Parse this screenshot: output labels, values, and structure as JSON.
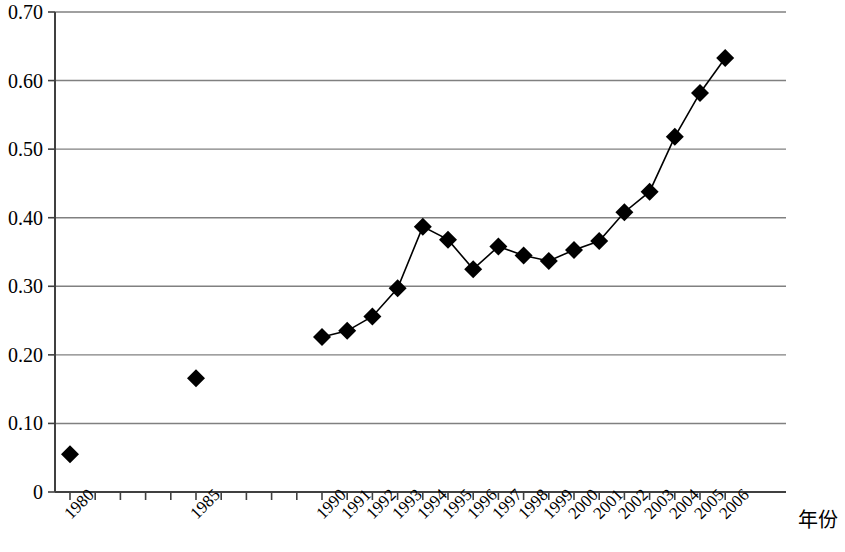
{
  "chart_data": {
    "type": "line",
    "title": "",
    "subtitle": "",
    "xlabel": "年份",
    "ylabel": "",
    "grid": true,
    "legend": null,
    "marker": "filled-diamond",
    "marker_color": "#000000",
    "line_color": "#000000",
    "grid_color": "#808080",
    "axis_color": "#404040",
    "xlim": [
      1979.5,
      2006.5
    ],
    "ylim": [
      0,
      0.7
    ],
    "y_ticks": [
      0,
      0.1,
      0.2,
      0.3,
      0.4,
      0.5,
      0.6,
      0.7
    ],
    "y_tick_labels": [
      "0",
      "0.10",
      "0.20",
      "0.30",
      "0.40",
      "0.50",
      "0.60",
      "0.70"
    ],
    "x_ticks": [
      1980,
      1981,
      1982,
      1983,
      1984,
      1985,
      1986,
      1987,
      1988,
      1989,
      1990,
      1991,
      1992,
      1993,
      1994,
      1995,
      1996,
      1997,
      1998,
      1999,
      2000,
      2001,
      2002,
      2003,
      2004,
      2005,
      2006
    ],
    "x_tick_labels": [
      "1980",
      "",
      "",
      "",
      "",
      "1985",
      "",
      "",
      "",
      "",
      "1990",
      "1991",
      "1992",
      "1993",
      "1994",
      "1995",
      "1996",
      "1997",
      "1998",
      "1999",
      "2000",
      "2001",
      "2002",
      "2003",
      "2004",
      "2005",
      "2006"
    ],
    "series": [
      {
        "name": "series-1",
        "connected": false,
        "x": [
          1980
        ],
        "values": [
          0.055
        ]
      },
      {
        "name": "series-2",
        "connected": false,
        "x": [
          1985
        ],
        "values": [
          0.166
        ]
      },
      {
        "name": "series-3",
        "connected": true,
        "x": [
          1990,
          1991,
          1992,
          1993,
          1994,
          1995,
          1996,
          1997,
          1998,
          1999,
          2000,
          2001,
          2002,
          2003,
          2004,
          2005
        ],
        "values": [
          0.226,
          0.235,
          0.256,
          0.297,
          0.387,
          0.368,
          0.325,
          0.358,
          0.345,
          0.337,
          0.353,
          0.366,
          0.408,
          0.438,
          0.518,
          0.582
        ]
      }
    ],
    "all_points": [
      {
        "x": 1980,
        "y": 0.055
      },
      {
        "x": 1985,
        "y": 0.166
      },
      {
        "x": 1990,
        "y": 0.226
      },
      {
        "x": 1991,
        "y": 0.235
      },
      {
        "x": 1992,
        "y": 0.256
      },
      {
        "x": 1993,
        "y": 0.297
      },
      {
        "x": 1994,
        "y": 0.387
      },
      {
        "x": 1995,
        "y": 0.368
      },
      {
        "x": 1996,
        "y": 0.325
      },
      {
        "x": 1997,
        "y": 0.358
      },
      {
        "x": 1998,
        "y": 0.345
      },
      {
        "x": 1999,
        "y": 0.337
      },
      {
        "x": 2000,
        "y": 0.353
      },
      {
        "x": 2001,
        "y": 0.366
      },
      {
        "x": 2002,
        "y": 0.408
      },
      {
        "x": 2003,
        "y": 0.438
      },
      {
        "x": 2004,
        "y": 0.518
      },
      {
        "x": 2005,
        "y": 0.582
      },
      {
        "x": 2006,
        "y": 0.633
      }
    ]
  }
}
